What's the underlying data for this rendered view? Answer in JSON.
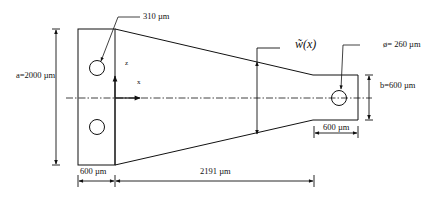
{
  "diagram": {
    "type": "tapered cantilever beam dimension drawing",
    "colors": {
      "stroke": "#111111",
      "background": "#ffffff"
    },
    "labels": {
      "hole_callout": "310 µm",
      "left_height": "a=2000 µm",
      "axis_z": "z",
      "axis_x": "x",
      "width_function": "w̃(x)",
      "hole_diameter": "ø= 260 µm",
      "right_height": "b=600 µm",
      "right_pad_width": "600 µm",
      "left_pad_width": "600 µm",
      "taper_length": "2191 µm"
    },
    "dimensions": {
      "a_um": 2000,
      "b_um": 600,
      "left_pad_um": 600,
      "right_pad_um": 600,
      "taper_um": 2191,
      "hole_diameter_um": 260,
      "hole_offset_um": 310
    }
  }
}
